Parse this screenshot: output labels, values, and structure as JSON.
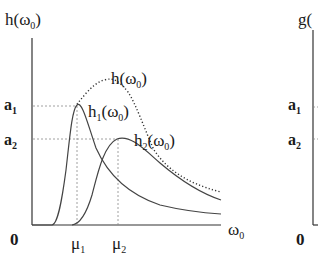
{
  "left_panel": {
    "y_axis_label": "h(ω",
    "y_axis_sub": "0",
    "x_axis_label": "ω",
    "x_axis_sub": "0",
    "origin": "0",
    "y_ticks": [
      {
        "label": "a",
        "sub": "1"
      },
      {
        "label": "a",
        "sub": "2"
      }
    ],
    "x_ticks": [
      {
        "label": "μ",
        "sub": "1"
      },
      {
        "label": "μ",
        "sub": "2"
      }
    ],
    "curves": [
      {
        "name": "h",
        "sub": "0",
        "label": "h(ω",
        "style": "dotted"
      },
      {
        "name": "h1",
        "label": "h",
        "label_sub": "1",
        "arg": "(ω",
        "arg_sub": "0",
        "style": "solid"
      },
      {
        "name": "h2",
        "label": "h",
        "label_sub": "2",
        "arg": "(ω",
        "arg_sub": "0",
        "style": "solid"
      }
    ]
  },
  "right_panel": {
    "y_axis_label": "g(",
    "origin": "0",
    "y_ticks": [
      {
        "label": "a",
        "sub": "1"
      },
      {
        "label": "a",
        "sub": "2"
      }
    ]
  },
  "colors": {
    "line": "#333333",
    "guide": "#888888"
  }
}
